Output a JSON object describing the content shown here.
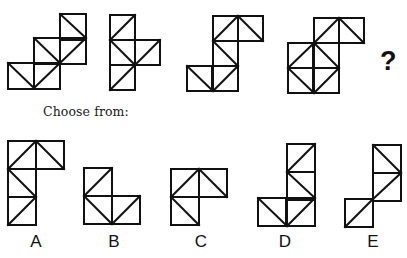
{
  "prompt": {
    "choose_label": "Choose from:",
    "question_mark": "?"
  },
  "style": {
    "stroke": "#111111",
    "stroke_width": 2,
    "background": "#ffffff"
  },
  "sequence": [
    {
      "id": "seq-1",
      "cell": 26,
      "cells": [
        [
          60,
          14
        ],
        [
          34,
          38
        ],
        [
          60,
          38
        ],
        [
          8,
          63
        ],
        [
          34,
          63
        ]
      ],
      "diagonals": [
        [
          60,
          14,
          86,
          38
        ],
        [
          34,
          38,
          60,
          63
        ],
        [
          86,
          38,
          60,
          63
        ],
        [
          60,
          63,
          34,
          88
        ],
        [
          8,
          63,
          34,
          88
        ]
      ]
    },
    {
      "id": "seq-2",
      "cell": 25,
      "cells": [
        [
          110,
          15
        ],
        [
          110,
          40
        ],
        [
          135,
          40
        ],
        [
          110,
          65
        ]
      ],
      "diagonals": [
        [
          135,
          15,
          110,
          40
        ],
        [
          110,
          40,
          135,
          65
        ],
        [
          160,
          40,
          135,
          65
        ],
        [
          135,
          65,
          110,
          90
        ]
      ]
    },
    {
      "id": "seq-3",
      "cell": 25,
      "cells": [
        [
          213,
          16
        ],
        [
          238,
          16
        ],
        [
          213,
          41
        ],
        [
          187,
          66
        ],
        [
          213,
          66
        ]
      ],
      "diagonals": [
        [
          238,
          16,
          213,
          41
        ],
        [
          238,
          16,
          263,
          41
        ],
        [
          213,
          41,
          238,
          66
        ],
        [
          238,
          66,
          213,
          91
        ],
        [
          187,
          66,
          213,
          91
        ]
      ]
    },
    {
      "id": "seq-4",
      "cell": 25,
      "cells": [
        [
          314,
          18
        ],
        [
          339,
          18
        ],
        [
          288,
          43
        ],
        [
          314,
          43
        ],
        [
          288,
          68
        ],
        [
          314,
          68
        ]
      ],
      "diagonals": [
        [
          339,
          18,
          314,
          43
        ],
        [
          339,
          18,
          364,
          43
        ],
        [
          314,
          43,
          288,
          68
        ],
        [
          314,
          43,
          339,
          68
        ],
        [
          288,
          68,
          314,
          93
        ],
        [
          339,
          68,
          314,
          93
        ]
      ]
    }
  ],
  "options": [
    {
      "label": "A",
      "label_x": 21,
      "cell": 28,
      "cells": [
        [
          8,
          141
        ],
        [
          36,
          141
        ],
        [
          8,
          169
        ],
        [
          8,
          197
        ]
      ],
      "diagonals": [
        [
          36,
          141,
          8,
          169
        ],
        [
          36,
          141,
          64,
          169
        ],
        [
          8,
          169,
          36,
          197
        ],
        [
          36,
          197,
          8,
          225
        ]
      ]
    },
    {
      "label": "B",
      "label_x": 99,
      "cell": 28,
      "cells": [
        [
          84,
          168
        ],
        [
          84,
          196
        ],
        [
          112,
          196
        ]
      ],
      "diagonals": [
        [
          112,
          168,
          84,
          196
        ],
        [
          84,
          196,
          112,
          224
        ],
        [
          140,
          196,
          112,
          224
        ]
      ]
    },
    {
      "label": "C",
      "label_x": 186,
      "cell": 28,
      "cells": [
        [
          171,
          169
        ],
        [
          199,
          169
        ],
        [
          171,
          197
        ]
      ],
      "diagonals": [
        [
          199,
          169,
          171,
          197
        ],
        [
          199,
          169,
          227,
          197
        ],
        [
          171,
          197,
          199,
          225
        ]
      ]
    },
    {
      "label": "D",
      "label_x": 270,
      "cell": 28,
      "cells": [
        [
          287,
          144
        ],
        [
          287,
          172
        ],
        [
          258,
          198
        ],
        [
          287,
          198
        ]
      ],
      "diagonals": [
        [
          315,
          144,
          287,
          172
        ],
        [
          287,
          172,
          315,
          198
        ],
        [
          258,
          198,
          287,
          226
        ],
        [
          315,
          198,
          287,
          226
        ]
      ]
    },
    {
      "label": "E",
      "label_x": 358,
      "cell": 28,
      "cells": [
        [
          373,
          145
        ],
        [
          373,
          173
        ],
        [
          345,
          199
        ]
      ],
      "diagonals": [
        [
          373,
          145,
          401,
          173
        ],
        [
          401,
          173,
          373,
          199
        ],
        [
          373,
          199,
          345,
          227
        ]
      ]
    }
  ]
}
